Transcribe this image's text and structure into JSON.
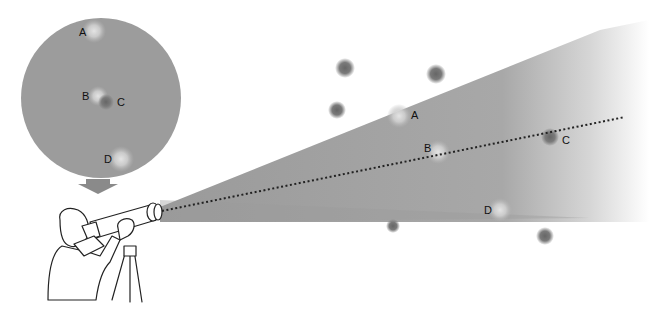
{
  "diagram": {
    "colors": {
      "cone": "#9e9e9e",
      "inset_disc": "#9a9a9a",
      "dark_star": "#6e6e6e",
      "bright_star": "#c8c8c8",
      "arrow": "#888888",
      "line_of_sight": "#222222"
    },
    "inset_view": {
      "labels": {
        "a": "A",
        "b": "B",
        "c": "C",
        "d": "D"
      }
    },
    "sky_field": {
      "labels": {
        "a": "A",
        "b": "B",
        "c": "C",
        "d": "D"
      }
    }
  }
}
